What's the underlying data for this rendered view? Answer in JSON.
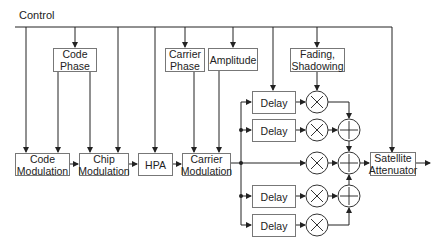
{
  "diagram": {
    "title_label": "Control",
    "blocks": {
      "code_phase": "Code\nPhase",
      "carrier_phase": "Carrier\nPhase",
      "amplitude": "Amplitude",
      "fading": "Fading,\nShadowing",
      "code_modulation": "Code\nModulation",
      "chip_modulation": "Chip\nModulation",
      "hpa": "HPA",
      "carrier_modulation": "Carrier\nModulation",
      "satellite_attenuator": "Satellite\nAttenuator",
      "delay_1": "Delay",
      "delay_2": "Delay",
      "delay_3": "Delay",
      "delay_4": "Delay"
    },
    "operators": {
      "multiplier_symbol": "×",
      "adder_symbol": "+",
      "multiplier_count": 5,
      "adder_count": 3
    },
    "colors": {
      "line": "#222222",
      "box_border": "#777777",
      "background": "#ffffff"
    }
  }
}
